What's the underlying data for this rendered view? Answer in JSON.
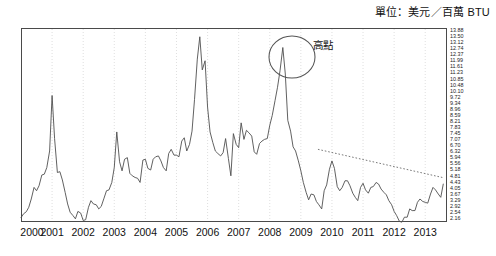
{
  "unit_note": "單位：美元／百萬 BTU",
  "annotation": {
    "label": "高點",
    "label_x": 313,
    "label_y": 37,
    "circle_cx": 292,
    "circle_cy": 57,
    "circle_rx": 23,
    "circle_ry": 21
  },
  "axis": {
    "y_labels": [
      "13.88",
      "13.50",
      "13.12",
      "12.74",
      "12.37",
      "11.99",
      "11.61",
      "11.23",
      "10.85",
      "10.48",
      "10.10",
      "9.72",
      "9.34",
      "8.96",
      "8.59",
      "8.21",
      "7.83",
      "7.45",
      "7.07",
      "6.70",
      "6.32",
      "5.94",
      "5.56",
      "5.18",
      "4.81",
      "4.43",
      "4.05",
      "3.67",
      "3.29",
      "2.92",
      "2.54",
      "2.16"
    ],
    "x_labels": [
      "2000",
      "2001",
      "2002",
      "2003",
      "2004",
      "2005",
      "2006",
      "2007",
      "2008",
      "2009",
      "2010",
      "2011",
      "2012",
      "2013"
    ]
  },
  "colors": {
    "line": "#4f4f4f",
    "frame": "#4a4a4a",
    "grid": "#c9c9c9",
    "annotation": "#555555",
    "trendline": "#6a6a6a"
  },
  "chart_data": {
    "type": "line",
    "title": "",
    "subtitle": "",
    "xlabel": "",
    "ylabel": "單位：美元／百萬 BTU",
    "xlim": [
      2000.0,
      2013.7
    ],
    "ylim": [
      2.16,
      13.88
    ],
    "grid": true,
    "legend": null,
    "y_tick_step": 0.38,
    "annotations": [
      {
        "text": "高點",
        "x": 2008.5,
        "y": 13.6,
        "type": "circle-callout",
        "note": "circled peak around mid-2008"
      }
    ],
    "trendline": {
      "type": "dashed",
      "x": [
        2009.55,
        2013.55
      ],
      "y": [
        6.55,
        4.85
      ],
      "note": "declining dotted trend from late 2009 to 2013"
    },
    "series": [
      {
        "name": "Natural gas price",
        "x": [
          2000.0,
          2000.08,
          2000.17,
          2000.25,
          2000.33,
          2000.42,
          2000.5,
          2000.58,
          2000.67,
          2000.75,
          2000.83,
          2000.92,
          2001.0,
          2001.08,
          2001.17,
          2001.25,
          2001.33,
          2001.42,
          2001.5,
          2001.58,
          2001.67,
          2001.75,
          2001.83,
          2001.92,
          2002.0,
          2002.08,
          2002.17,
          2002.25,
          2002.33,
          2002.42,
          2002.5,
          2002.58,
          2002.67,
          2002.75,
          2002.83,
          2002.92,
          2003.0,
          2003.08,
          2003.17,
          2003.25,
          2003.33,
          2003.42,
          2003.5,
          2003.58,
          2003.67,
          2003.75,
          2003.83,
          2003.92,
          2004.0,
          2004.08,
          2004.17,
          2004.25,
          2004.33,
          2004.42,
          2004.5,
          2004.58,
          2004.67,
          2004.75,
          2004.83,
          2004.92,
          2005.0,
          2005.08,
          2005.17,
          2005.25,
          2005.33,
          2005.42,
          2005.5,
          2005.58,
          2005.67,
          2005.75,
          2005.83,
          2005.92,
          2006.0,
          2006.08,
          2006.17,
          2006.25,
          2006.33,
          2006.42,
          2006.5,
          2006.58,
          2006.67,
          2006.75,
          2006.83,
          2006.92,
          2007.0,
          2007.08,
          2007.17,
          2007.25,
          2007.33,
          2007.42,
          2007.5,
          2007.58,
          2007.67,
          2007.75,
          2007.83,
          2007.92,
          2008.0,
          2008.08,
          2008.17,
          2008.25,
          2008.33,
          2008.42,
          2008.5,
          2008.58,
          2008.67,
          2008.75,
          2008.83,
          2008.92,
          2009.0,
          2009.08,
          2009.17,
          2009.25,
          2009.33,
          2009.42,
          2009.5,
          2009.58,
          2009.67,
          2009.75,
          2009.83,
          2009.92,
          2010.0,
          2010.08,
          2010.17,
          2010.25,
          2010.33,
          2010.42,
          2010.5,
          2010.58,
          2010.67,
          2010.75,
          2010.83,
          2010.92,
          2011.0,
          2011.08,
          2011.17,
          2011.25,
          2011.33,
          2011.42,
          2011.5,
          2011.58,
          2011.67,
          2011.75,
          2011.83,
          2011.92,
          2012.0,
          2012.08,
          2012.17,
          2012.25,
          2012.33,
          2012.42,
          2012.5,
          2012.58,
          2012.67,
          2012.75,
          2012.83,
          2012.92,
          2013.0,
          2013.08,
          2013.17,
          2013.25,
          2013.33,
          2013.42,
          2013.5,
          2013.58
        ],
        "y": [
          2.42,
          2.65,
          2.78,
          3.05,
          3.55,
          4.25,
          4.05,
          4.35,
          5.0,
          5.05,
          5.45,
          6.45,
          9.8,
          7.2,
          5.15,
          5.2,
          4.7,
          3.95,
          3.25,
          2.75,
          2.55,
          2.35,
          2.8,
          2.7,
          2.25,
          2.3,
          3.05,
          3.45,
          3.25,
          3.2,
          2.95,
          3.1,
          3.6,
          4.05,
          4.1,
          4.55,
          5.45,
          7.6,
          5.8,
          5.25,
          5.95,
          6.05,
          5.1,
          4.95,
          4.85,
          4.8,
          4.55,
          5.9,
          5.95,
          5.4,
          5.3,
          5.95,
          6.1,
          6.15,
          5.85,
          5.45,
          5.25,
          6.3,
          6.55,
          6.2,
          6.2,
          6.1,
          7.05,
          7.25,
          6.45,
          6.85,
          7.65,
          9.55,
          12.0,
          13.35,
          11.35,
          11.9,
          9.1,
          7.6,
          6.95,
          6.45,
          6.3,
          6.15,
          6.35,
          7.2,
          6.0,
          4.95,
          7.5,
          6.85,
          6.65,
          8.15,
          7.15,
          7.7,
          7.55,
          7.35,
          6.4,
          6.25,
          6.9,
          7.05,
          7.15,
          7.2,
          8.0,
          8.6,
          9.5,
          10.3,
          11.3,
          12.7,
          11.1,
          8.3,
          7.65,
          6.7,
          6.45,
          5.85,
          5.25,
          4.55,
          3.95,
          3.5,
          3.85,
          3.8,
          3.4,
          3.2,
          2.95,
          4.05,
          4.4,
          5.35,
          5.85,
          5.4,
          4.3,
          4.05,
          4.25,
          4.65,
          4.65,
          4.35,
          3.9,
          3.65,
          3.45,
          4.25,
          4.5,
          4.1,
          3.9,
          4.25,
          4.3,
          4.55,
          4.45,
          4.15,
          3.95,
          3.8,
          3.45,
          3.2,
          2.8,
          2.55,
          2.2,
          2.15,
          2.45,
          2.45,
          2.95,
          2.85,
          2.85,
          3.35,
          3.55,
          3.4,
          3.35,
          3.3,
          3.85,
          4.25,
          4.1,
          3.85,
          3.65,
          4.45
        ],
        "color": "#4f4f4f"
      }
    ]
  }
}
